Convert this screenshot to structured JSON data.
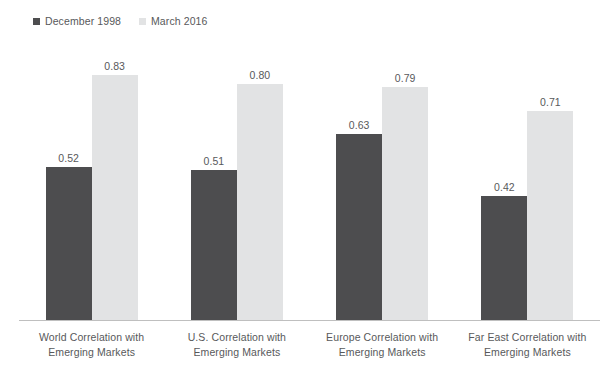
{
  "legend": {
    "items": [
      {
        "label": "December 1998",
        "color": "#4d4d4f",
        "marker": "square-marker"
      },
      {
        "label": "March 2016",
        "color": "#e2e3e4",
        "marker": "square-marker"
      }
    ]
  },
  "axis": {
    "baseline_color": "#bfbfbf"
  },
  "categories": [
    {
      "line1": "World Correlation with",
      "line2": "Emerging Markets"
    },
    {
      "line1": "U.S. Correlation with",
      "line2": "Emerging Markets"
    },
    {
      "line1": "Europe Correlation with",
      "line2": "Emerging Markets"
    },
    {
      "line1": "Far East Correlation with",
      "line2": "Emerging Markets"
    }
  ],
  "bar_labels": {
    "g0s0": "0.52",
    "g0s1": "0.83",
    "g1s0": "0.51",
    "g1s1": "0.80",
    "g2s0": "0.63",
    "g2s1": "0.79",
    "g3s0": "0.42",
    "g3s1": "0.71"
  },
  "chart_data": {
    "type": "bar",
    "title": "",
    "subtitle": "",
    "xlabel": "",
    "ylabel": "",
    "ylim": [
      0,
      0.95
    ],
    "grid": false,
    "legend_position": "top-left",
    "categories": [
      "World Correlation with Emerging Markets",
      "U.S. Correlation with Emerging Markets",
      "Europe Correlation with Emerging Markets",
      "Far East Correlation with Emerging Markets"
    ],
    "series": [
      {
        "name": "December 1998",
        "color": "#4d4d4f",
        "values": [
          0.52,
          0.51,
          0.63,
          0.42
        ]
      },
      {
        "name": "March 2016",
        "color": "#e2e3e4",
        "values": [
          0.83,
          0.8,
          0.79,
          0.71
        ]
      }
    ],
    "data_labels": [
      [
        "0.52",
        "0.83"
      ],
      [
        "0.51",
        "0.80"
      ],
      [
        "0.63",
        "0.79"
      ],
      [
        "0.42",
        "0.71"
      ]
    ]
  }
}
